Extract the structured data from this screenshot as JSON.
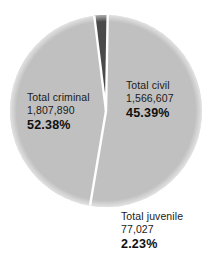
{
  "chart_data": {
    "type": "pie",
    "title": "",
    "subtitle": "",
    "xlabel": "",
    "ylabel": "",
    "legend_position": "none",
    "grid": false,
    "labels_inside": true,
    "total": 3451524,
    "categories": [
      "Total criminal",
      "Total civil",
      "Total juvenile"
    ],
    "values": [
      1807890,
      1566607,
      77027
    ],
    "percentages": [
      52.38,
      45.39,
      2.23
    ],
    "colors": [
      "#c0c0c0",
      "#c0c0c0",
      "#4a4a4a"
    ],
    "slice_separator_color": "#ffffff",
    "background_color": "#ffffff",
    "slices": [
      {
        "name": "Total criminal",
        "value_text": "1,807,890",
        "percent_text": "52.38%",
        "value": 1807890,
        "percent": 52.38,
        "color": "#c0c0c0"
      },
      {
        "name": "Total civil",
        "value_text": "1,566,607",
        "percent_text": "45.39%",
        "value": 1566607,
        "percent": 45.39,
        "color": "#c0c0c0"
      },
      {
        "name": "Total juvenile",
        "value_text": "77,027",
        "percent_text": "2.23%",
        "value": 77027,
        "percent": 2.23,
        "color": "#4a4a4a"
      }
    ]
  },
  "geometry": {
    "center_x": 106,
    "center_y": 111,
    "radius": 96,
    "start_angle_deg": -89
  }
}
